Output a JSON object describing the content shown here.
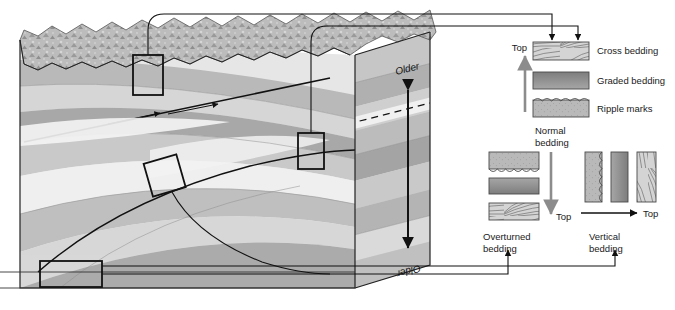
{
  "figure": {
    "block": {
      "older_top_label": "Older",
      "older_bottom_label": "Older",
      "sample_box_count": 4
    },
    "legend_normal": {
      "top_label": "Top",
      "caption_line1": "Normal",
      "caption_line2": "bedding",
      "items": [
        {
          "name": "cross-bedding",
          "label": "Cross bedding"
        },
        {
          "name": "graded-bedding",
          "label": "Graded bedding"
        },
        {
          "name": "ripple-marks",
          "label": "Ripple marks"
        }
      ]
    },
    "overturned": {
      "top_label": "Top",
      "caption_line1": "Overturned",
      "caption_line2": "bedding",
      "order": [
        "ripple-marks",
        "graded-bedding",
        "cross-bedding"
      ]
    },
    "vertical": {
      "top_label": "Top",
      "caption_line1": "Vertical",
      "caption_line2": "bedding",
      "order": [
        "ripple-marks",
        "graded-bedding",
        "cross-bedding"
      ]
    },
    "colors": {
      "line": "#111111",
      "swatch_light": "#c8c8c8",
      "swatch_dark": "#8a8a8a",
      "swatch_mid": "#b4b4b4",
      "arrow_gray": "#8c8c8c",
      "strata_1": "#e9e9e9",
      "strata_2": "#d2d2d2",
      "strata_3": "#bdbdbd",
      "strata_4": "#a8a8a8",
      "strata_5": "#949494"
    }
  }
}
